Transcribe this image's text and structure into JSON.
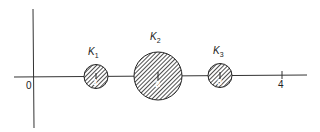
{
  "diagram": {
    "axes": {
      "origin_label": "0",
      "tick_label": "4"
    },
    "clusters": [
      {
        "name": "K",
        "subscript": "1",
        "point_label": "1",
        "radius": "small"
      },
      {
        "name": "K",
        "subscript": "2",
        "point_label": "2",
        "radius": "large"
      },
      {
        "name": "K",
        "subscript": "3",
        "point_label": "3",
        "radius": "small"
      }
    ],
    "colors": {
      "ink": "#222222",
      "background": "#ffffff"
    }
  }
}
